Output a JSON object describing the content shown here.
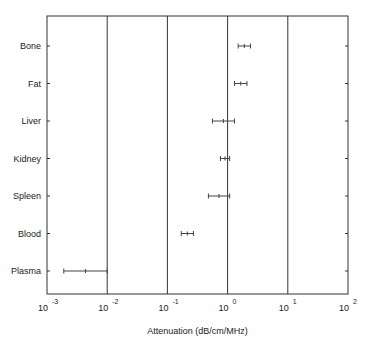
{
  "chart_data": {
    "type": "scatter",
    "subtype": "horizontal-range",
    "title": "",
    "xlabel": "Attenuation (dB/cm/MHz)",
    "ylabel": "",
    "xscale": "log",
    "xlim": [
      0.001,
      100
    ],
    "x_tick_labels": [
      "10^-3",
      "10^-2",
      "10^-1",
      "10^0",
      "10^1",
      "10^2"
    ],
    "grid": "vertical lines at decades",
    "categories": [
      "Bone",
      "Fat",
      "Liver",
      "Kidney",
      "Spleen",
      "Blood",
      "Plasma"
    ],
    "series": [
      {
        "name": "min",
        "values": [
          1.5,
          1.3,
          0.56,
          0.76,
          0.48,
          0.17,
          0.0019
        ]
      },
      {
        "name": "max",
        "values": [
          2.4,
          2.1,
          1.3,
          1.08,
          1.08,
          0.27,
          0.01
        ]
      }
    ]
  },
  "labels": {
    "xlabel": "Attenuation (dB/cm/MHz)",
    "ticks": [
      {
        "base": "10",
        "exp": "-3"
      },
      {
        "base": "10",
        "exp": "-2"
      },
      {
        "base": "10",
        "exp": "-1"
      },
      {
        "base": "10",
        "exp": "0"
      },
      {
        "base": "10",
        "exp": "1"
      },
      {
        "base": "10",
        "exp": "2"
      }
    ],
    "categories": [
      "Bone",
      "Fat",
      "Liver",
      "Kidney",
      "Spleen",
      "Blood",
      "Plasma"
    ]
  }
}
